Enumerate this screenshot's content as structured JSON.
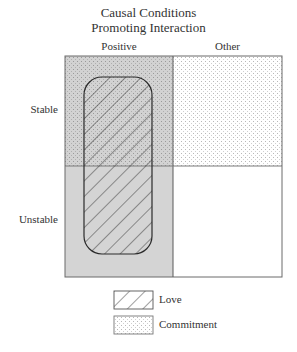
{
  "title": {
    "line1": "Causal Conditions",
    "line2": "Promoting Interaction"
  },
  "columns": [
    {
      "label": "Positive"
    },
    {
      "label": "Other"
    }
  ],
  "rows": [
    {
      "label": "Stable"
    },
    {
      "label": "Unstable"
    }
  ],
  "cells": {
    "stable_positive": {
      "fill": "gray-dotted",
      "pattern": "commitment",
      "shade": "#d4d4d4"
    },
    "stable_other": {
      "fill": "white-dotted",
      "pattern": "commitment",
      "shade": "#ffffff"
    },
    "unstable_positive": {
      "fill": "gray",
      "shade": "#d4d4d4"
    },
    "unstable_other": {
      "fill": "white",
      "shade": "#ffffff"
    }
  },
  "overlay": {
    "label": "Love",
    "pattern": "diagonal-hatch",
    "spans": [
      "stable_positive",
      "unstable_positive"
    ]
  },
  "legend": [
    {
      "label": "Love",
      "pattern": "diagonal-hatch"
    },
    {
      "label": "Commitment",
      "pattern": "dots"
    }
  ]
}
